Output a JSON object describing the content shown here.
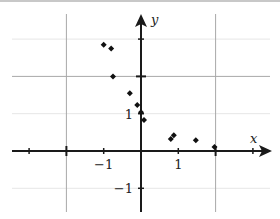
{
  "chart_data": {
    "type": "scatter",
    "title": "",
    "xlabel": "x",
    "ylabel": "y",
    "xlim": [
      -3.4,
      3.7
    ],
    "ylim": [
      -2.5,
      4.0
    ],
    "grid": {
      "major_x": [
        -2,
        2
      ],
      "major_y": [
        2
      ],
      "minor_y": [
        -1,
        1,
        3
      ]
    },
    "x_ticks": [
      -3,
      -2,
      -1,
      1,
      2,
      3
    ],
    "y_ticks": [
      -1,
      1,
      2,
      3
    ],
    "x_tick_labels": [
      {
        "value": -1,
        "text": "−1"
      },
      {
        "value": 1,
        "text": "1"
      }
    ],
    "y_tick_labels": [
      {
        "value": 1,
        "text": "1"
      },
      {
        "value": -1,
        "text": "−1"
      }
    ],
    "points": [
      {
        "x": -1.0,
        "y": 2.85
      },
      {
        "x": -0.8,
        "y": 2.75
      },
      {
        "x": -0.75,
        "y": 2.0
      },
      {
        "x": -0.3,
        "y": 1.55
      },
      {
        "x": -0.1,
        "y": 1.23
      },
      {
        "x": 0.0,
        "y": 1.04
      },
      {
        "x": 0.08,
        "y": 0.83
      },
      {
        "x": 0.8,
        "y": 0.32
      },
      {
        "x": 0.88,
        "y": 0.42
      },
      {
        "x": 1.47,
        "y": 0.29
      },
      {
        "x": 1.97,
        "y": 0.11
      }
    ],
    "marker": "diamond",
    "colors": {
      "axis": "#1a1a1a",
      "grid_major": "#a8a8a8",
      "grid_minor": "#e6e6e6",
      "point": "#111111"
    }
  },
  "axes": {
    "x_label": "x",
    "y_label": "y"
  }
}
